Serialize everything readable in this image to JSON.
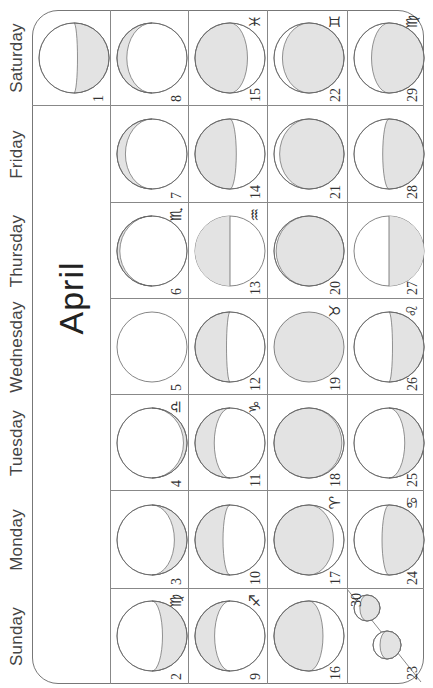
{
  "calendar": {
    "month": "April",
    "days_of_week": [
      "Sunday",
      "Monday",
      "Tuesday",
      "Wednesday",
      "Thursday",
      "Friday",
      "Saturday"
    ],
    "colors": {
      "moon_shadow": "#e3e3e3",
      "moon_lit": "#ffffff",
      "line": "#888888",
      "text": "#333333"
    },
    "weeks": [
      [
        null,
        null,
        null,
        null,
        null,
        null,
        {
          "day": "1",
          "zodiac": "",
          "phase": "waxing-thin-bottom"
        }
      ],
      [
        {
          "day": "2",
          "zodiac": "♍"
        },
        {
          "day": "3",
          "zodiac": ""
        },
        {
          "day": "4",
          "zodiac": "♎"
        },
        {
          "day": "5",
          "zodiac": ""
        },
        {
          "day": "6",
          "zodiac": "♏"
        },
        {
          "day": "7",
          "zodiac": ""
        },
        {
          "day": "8",
          "zodiac": ""
        }
      ],
      [
        {
          "day": "9",
          "zodiac": "♐"
        },
        {
          "day": "10",
          "zodiac": ""
        },
        {
          "day": "11",
          "zodiac": "♑"
        },
        {
          "day": "12",
          "zodiac": ""
        },
        {
          "day": "13",
          "zodiac": "♒"
        },
        {
          "day": "14",
          "zodiac": ""
        },
        {
          "day": "15",
          "zodiac": "♓"
        }
      ],
      [
        {
          "day": "16",
          "zodiac": ""
        },
        {
          "day": "17",
          "zodiac": "♈"
        },
        {
          "day": "18",
          "zodiac": ""
        },
        {
          "day": "19",
          "zodiac": "♉"
        },
        {
          "day": "20",
          "zodiac": ""
        },
        {
          "day": "21",
          "zodiac": ""
        },
        {
          "day": "22",
          "zodiac": "♊"
        }
      ],
      [
        {
          "day": "23",
          "zodiac": "",
          "shared_with": "30"
        },
        {
          "day": "24",
          "zodiac": "♋"
        },
        {
          "day": "25",
          "zodiac": ""
        },
        {
          "day": "26",
          "zodiac": "♌"
        },
        {
          "day": "27",
          "zodiac": ""
        },
        {
          "day": "28",
          "zodiac": ""
        },
        {
          "day": "29",
          "zodiac": "♍"
        }
      ]
    ],
    "split_cell": {
      "day_a": "23",
      "day_b": "30"
    }
  }
}
